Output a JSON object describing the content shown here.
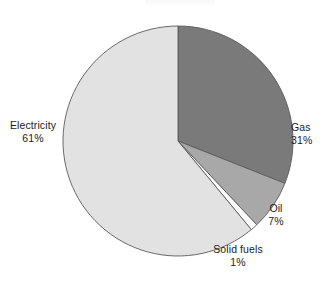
{
  "chart_data": {
    "type": "pie",
    "title": "",
    "xlabel": "",
    "ylabel": "",
    "categories": [
      "Gas",
      "Oil",
      "Solid fuels",
      "Electricity"
    ],
    "values": [
      31,
      7,
      1,
      61
    ],
    "unit": "%",
    "total": 100,
    "start_angle_deg": 0,
    "direction": "clockwise",
    "legend_position": "outside-labels",
    "grid": false,
    "slices": [
      {
        "label": "Gas",
        "value": 31,
        "value_text": "31%",
        "color": "#7a7a7a",
        "start_deg": 0,
        "end_deg": 111.6
      },
      {
        "label": "Oil",
        "value": 7,
        "value_text": "7%",
        "color": "#a8a8a8",
        "start_deg": 111.6,
        "end_deg": 136.8
      },
      {
        "label": "Solid fuels",
        "value": 1,
        "value_text": "1%",
        "color": "#fcfcfc",
        "start_deg": 136.8,
        "end_deg": 140.4
      },
      {
        "label": "Electricity",
        "value": 61,
        "value_text": "61%",
        "color": "#e2e2e2",
        "start_deg": 140.4,
        "end_deg": 360
      }
    ],
    "geometry": {
      "center_x": 178,
      "center_y": 141,
      "radius": 115
    },
    "style": {
      "outline_color": "#5a5a5a",
      "outline_width": 0.9,
      "text_color": "#1b1b1b",
      "background": "#ffffff"
    }
  },
  "labels": {
    "electricity": {
      "name": "Electricity",
      "value": "61%"
    },
    "gas": {
      "name": "Gas",
      "value": "31%"
    },
    "oil": {
      "name": "Oil",
      "value": "7%"
    },
    "solid_fuels": {
      "name": "Solid fuels",
      "value": "1%"
    }
  }
}
